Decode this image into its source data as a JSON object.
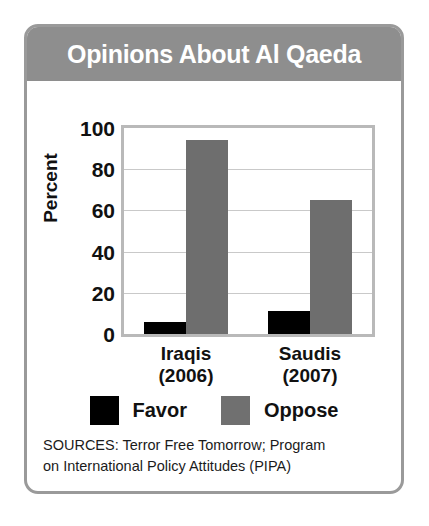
{
  "header": {
    "title": "Opinions About Al Qaeda",
    "background_color": "#8e8e8e",
    "text_color": "#ffffff"
  },
  "colors": {
    "favor": "#000000",
    "oppose": "#6e6e6e",
    "card_border": "#9a9a9a",
    "plot_border": "#b9b9b9",
    "gridline": "#c9c9c9"
  },
  "legend": {
    "entries": [
      {
        "label": "Favor",
        "color": "#000000"
      },
      {
        "label": "Oppose",
        "color": "#707070"
      }
    ]
  },
  "sources": {
    "line1": "SOURCES: Terror Free Tomorrow; Program",
    "line2": "on International Policy Attitudes (PIPA)"
  },
  "chart_data": {
    "type": "bar",
    "title": "Opinions About Al Qaeda",
    "xlabel": "",
    "ylabel": "Percent",
    "ylim": [
      0,
      100
    ],
    "yticks": [
      100,
      80,
      60,
      40,
      20,
      0
    ],
    "grid": true,
    "legend_position": "bottom",
    "categories": [
      "Iraqis (2006)",
      "Saudis (2007)"
    ],
    "category_lines": [
      {
        "name": "Iraqis",
        "year": "(2006)"
      },
      {
        "name": "Saudis",
        "year": "(2007)"
      }
    ],
    "series": [
      {
        "name": "Favor",
        "color": "#000000",
        "values": [
          6,
          11
        ]
      },
      {
        "name": "Oppose",
        "color": "#6e6e6e",
        "values": [
          94,
          65
        ]
      }
    ]
  }
}
